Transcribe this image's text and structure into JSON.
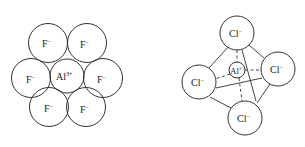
{
  "diagrams": [
    {
      "name": "AlF3 ionic packing",
      "central_ion": {
        "symbol": "Al",
        "charge": "3+"
      },
      "ligands": [
        {
          "symbol": "F",
          "charge": "−"
        },
        {
          "symbol": "F",
          "charge": "−"
        },
        {
          "symbol": "F",
          "charge": "−"
        },
        {
          "symbol": "F",
          "charge": "−"
        },
        {
          "symbol": "F",
          "charge": "−"
        },
        {
          "symbol": "F",
          "charge": "−"
        }
      ]
    },
    {
      "name": "AlCl4- tetrahedral",
      "central_ion": {
        "symbol": "Al",
        "charge": "3+"
      },
      "ligands": [
        {
          "symbol": "Cl",
          "charge": "−"
        },
        {
          "symbol": "Cl",
          "charge": "−"
        },
        {
          "symbol": "Cl",
          "charge": "−"
        },
        {
          "symbol": "Cl",
          "charge": "−"
        }
      ]
    }
  ]
}
